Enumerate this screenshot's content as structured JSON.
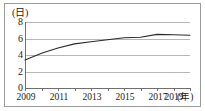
{
  "chart_data": {
    "type": "line",
    "title": "",
    "subtitle": "",
    "xlabel": "(年)",
    "ylabel": "(日)",
    "x": [
      2009,
      2010,
      2011,
      2012,
      2013,
      2014,
      2015,
      2016,
      2017,
      2018,
      2019
    ],
    "series": [
      {
        "name": "",
        "values": [
          3.4,
          4.2,
          4.85,
          5.35,
          5.6,
          5.85,
          6.1,
          6.15,
          6.5,
          6.45,
          6.4
        ]
      }
    ],
    "xlim": [
      2009,
      2019
    ],
    "ylim": [
      0,
      8
    ],
    "yticks": [
      0,
      2,
      4,
      6,
      8
    ],
    "xticks": [
      2009,
      2010,
      2011,
      2012,
      2013,
      2014,
      2015,
      2016,
      2017,
      2018,
      2019
    ],
    "xtick_labels_shown": [
      2009,
      2011,
      2013,
      2015,
      2017,
      2019
    ],
    "grid": true,
    "legend": "none",
    "line_color": "#2b2b2b",
    "grid_color": "#b6b6b6",
    "axis_color": "#6f6f6f",
    "border_color": "#9a9a9a",
    "background": "#ffffff"
  },
  "axes": {
    "y_unit_label": "(日)",
    "x_unit_label": "(年)",
    "y_tick_labels": [
      "8",
      "6",
      "4",
      "2",
      "0"
    ],
    "x_tick_labels": [
      "2009",
      "2011",
      "2013",
      "2015",
      "2017",
      "2019"
    ]
  }
}
